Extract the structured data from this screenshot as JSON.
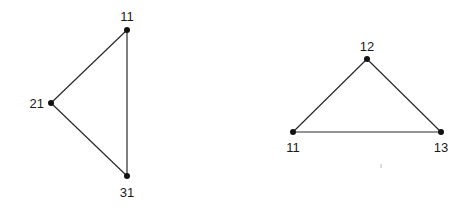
{
  "diagram": {
    "type": "graph",
    "graphs": [
      {
        "id": "left-triangle",
        "nodes": [
          {
            "label": "11",
            "x": 127,
            "y": 30,
            "label_x": 127,
            "label_y": 21,
            "anchor": "middle"
          },
          {
            "label": "21",
            "x": 51,
            "y": 103,
            "label_x": 44,
            "label_y": 108,
            "anchor": "end"
          },
          {
            "label": "31",
            "x": 127,
            "y": 176,
            "label_x": 127,
            "label_y": 197,
            "anchor": "middle"
          }
        ],
        "edges": [
          {
            "from": "11",
            "to": "21"
          },
          {
            "from": "11",
            "to": "31"
          },
          {
            "from": "21",
            "to": "31"
          }
        ]
      },
      {
        "id": "right-triangle",
        "nodes": [
          {
            "label": "12",
            "x": 367,
            "y": 59,
            "label_x": 367,
            "label_y": 51,
            "anchor": "middle"
          },
          {
            "label": "11",
            "x": 293,
            "y": 132,
            "label_x": 293,
            "label_y": 152,
            "anchor": "middle"
          },
          {
            "label": "13",
            "x": 441,
            "y": 132,
            "label_x": 441,
            "label_y": 152,
            "anchor": "middle"
          }
        ],
        "edges": [
          {
            "from": "12",
            "to": "11"
          },
          {
            "from": "12",
            "to": "13"
          },
          {
            "from": "11",
            "to": "13"
          }
        ]
      }
    ]
  }
}
